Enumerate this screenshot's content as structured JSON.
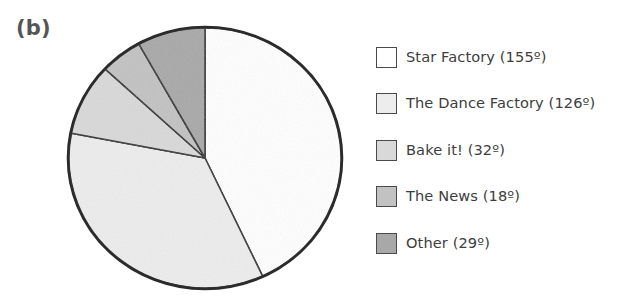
{
  "figure": {
    "panel_label": "(b)"
  },
  "chart_data": {
    "type": "pie",
    "title": "",
    "units": "degrees",
    "total_degrees": 360,
    "start_angle_deg": 0,
    "direction": "clockwise",
    "categories": [
      "Star Factory",
      "The Dance Factory",
      "Bake it!",
      "The News",
      "Other"
    ],
    "values": [
      155,
      126,
      32,
      18,
      29
    ],
    "labels": [
      "Star Factory (155º)",
      "The Dance Factory (126º)",
      "Bake it! (32º)",
      "The News (18º)",
      "Other (29º)"
    ],
    "colors": [
      "#ffffff",
      "#ededed",
      "#d9d9d9",
      "#c2c2c2",
      "#a8a8a8"
    ],
    "outline_color": "#2b2b2b",
    "legend_position": "right",
    "grid": false
  },
  "legend": {
    "items": [
      {
        "label": "Star Factory (155º)",
        "color": "#ffffff"
      },
      {
        "label": "The Dance Factory (126º)",
        "color": "#ededed"
      },
      {
        "label": "Bake it! (32º)",
        "color": "#d9d9d9"
      },
      {
        "label": "The News (18º)",
        "color": "#c2c2c2"
      },
      {
        "label": "Other (29º)",
        "color": "#a8a8a8"
      }
    ]
  }
}
